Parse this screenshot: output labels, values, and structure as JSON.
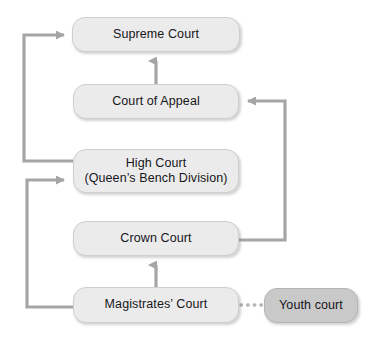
{
  "diagram": {
    "colors": {
      "background": "#ffffff",
      "node_fill": "#ebebeb",
      "node_fill_highlight": "#c9c9c9",
      "node_border": "#cfcfcf",
      "connector": "#a5a5a5",
      "text": "#16161a"
    },
    "nodes": [
      {
        "id": "supreme-court",
        "label": "Supreme Court",
        "style": "light"
      },
      {
        "id": "court-of-appeal",
        "label": "Court of Appeal",
        "style": "light"
      },
      {
        "id": "high-court",
        "label": "High Court\n(Queen’s Bench Division)",
        "style": "light"
      },
      {
        "id": "crown-court",
        "label": "Crown Court",
        "style": "light"
      },
      {
        "id": "magistrates-court",
        "label": "Magistrates’ Court",
        "style": "light"
      },
      {
        "id": "youth-court",
        "label": "Youth court",
        "style": "dark"
      }
    ],
    "connectors": [
      {
        "id": "court-of-appeal-to-supreme-court",
        "from": "court-of-appeal",
        "to": "supreme-court",
        "kind": "arrow-up",
        "line": "solid"
      },
      {
        "id": "high-court-to-supreme-court",
        "from": "high-court",
        "to": "supreme-court",
        "kind": "arrow-left-loop",
        "line": "solid"
      },
      {
        "id": "crown-court-to-court-of-appeal",
        "from": "crown-court",
        "to": "court-of-appeal",
        "kind": "arrow-right-loop",
        "line": "solid"
      },
      {
        "id": "magistrates-court-to-high-court",
        "from": "magistrates-court",
        "to": "high-court",
        "kind": "arrow-left-loop",
        "line": "solid"
      },
      {
        "id": "magistrates-court-to-crown-court",
        "from": "magistrates-court",
        "to": "crown-court",
        "kind": "arrow-up",
        "line": "solid"
      },
      {
        "id": "magistrates-court-to-youth-court",
        "from": "magistrates-court",
        "to": "youth-court",
        "kind": "link",
        "line": "dotted"
      }
    ]
  }
}
